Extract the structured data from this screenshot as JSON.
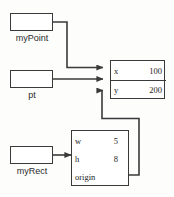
{
  "diagram": {
    "background_color": "#fdfdfc",
    "line_color": "#3a3a3a",
    "variables": [
      {
        "id": "myPoint",
        "label": "myPoint",
        "points_to": "point-object"
      },
      {
        "id": "pt",
        "label": "pt",
        "points_to": "point-object"
      },
      {
        "id": "myRect",
        "label": "myRect",
        "points_to": "rect-object"
      }
    ],
    "objects": [
      {
        "id": "point-object",
        "name": "Point",
        "fields": [
          {
            "name": "x",
            "value": "100"
          },
          {
            "name": "y",
            "value": "200"
          }
        ]
      },
      {
        "id": "rect-object",
        "name": "Rect",
        "fields": [
          {
            "name": "w",
            "value": "5"
          },
          {
            "name": "h",
            "value": "8"
          },
          {
            "name": "origin",
            "value": ""
          }
        ]
      }
    ],
    "arrows": [
      {
        "from": "myPoint",
        "to": "point-object.x",
        "style": "elbow"
      },
      {
        "from": "pt",
        "to": "point-object.x",
        "style": "straight"
      },
      {
        "from": "origin",
        "to": "point-object.y",
        "style": "elbow"
      },
      {
        "from": "myRect",
        "to": "rect-object",
        "style": "straight"
      }
    ]
  }
}
